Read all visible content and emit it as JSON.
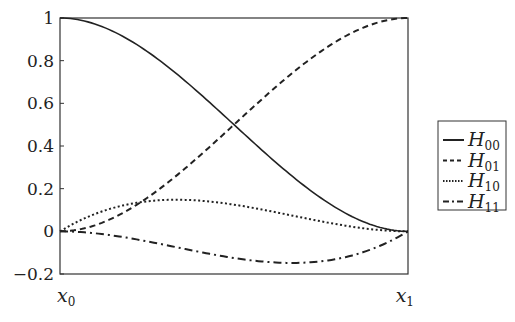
{
  "chart_data": {
    "type": "line",
    "title": "",
    "xlabel": "",
    "ylabel": "",
    "x_tick_labels": [
      {
        "base": "x",
        "sub": "0"
      },
      {
        "base": "x",
        "sub": "1"
      }
    ],
    "y_ticks": [
      1,
      0.8,
      0.6,
      0.4,
      0.2,
      0,
      -0.2
    ],
    "y_tick_labels": [
      "1",
      "0.8",
      "0.6",
      "0.4",
      "0.2",
      "0",
      "−0.2"
    ],
    "xlim": [
      0,
      1
    ],
    "ylim": [
      -0.2,
      1
    ],
    "grid": false,
    "legend_position": "right",
    "series": [
      {
        "name": "H00",
        "label_base": "H",
        "label_sub": "00",
        "style": "solid",
        "x": [
          0,
          0.1,
          0.2,
          0.3,
          0.4,
          0.5,
          0.6,
          0.7,
          0.8,
          0.9,
          1
        ],
        "values": [
          1,
          0.972,
          0.896,
          0.784,
          0.648,
          0.5,
          0.352,
          0.216,
          0.104,
          0.028,
          0
        ]
      },
      {
        "name": "H01",
        "label_base": "H",
        "label_sub": "01",
        "style": "dashed",
        "x": [
          0,
          0.1,
          0.2,
          0.3,
          0.4,
          0.5,
          0.6,
          0.7,
          0.8,
          0.9,
          1
        ],
        "values": [
          0,
          0.028,
          0.104,
          0.216,
          0.352,
          0.5,
          0.648,
          0.784,
          0.896,
          0.972,
          1
        ]
      },
      {
        "name": "H10",
        "label_base": "H",
        "label_sub": "10",
        "style": "dotted",
        "x": [
          0,
          0.1,
          0.2,
          0.3,
          0.4,
          0.5,
          0.6,
          0.7,
          0.8,
          0.9,
          1
        ],
        "values": [
          0,
          0.081,
          0.128,
          0.147,
          0.144,
          0.125,
          0.096,
          0.063,
          0.032,
          0.009,
          0
        ]
      },
      {
        "name": "H11",
        "label_base": "H",
        "label_sub": "11",
        "style": "dashdot",
        "x": [
          0,
          0.1,
          0.2,
          0.3,
          0.4,
          0.5,
          0.6,
          0.7,
          0.8,
          0.9,
          1
        ],
        "values": [
          0,
          -0.009,
          -0.032,
          -0.063,
          -0.096,
          -0.125,
          -0.144,
          -0.147,
          -0.128,
          -0.081,
          0
        ]
      }
    ]
  }
}
